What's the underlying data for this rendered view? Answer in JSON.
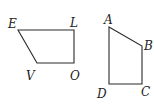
{
  "figure": {
    "stroke_color": "#2a2a2a",
    "label_color": "#222222",
    "shapes": [
      {
        "name": "EVOL",
        "vertices": [
          {
            "label": "E",
            "x": 18,
            "y": 30,
            "lx": 8,
            "ly": 28
          },
          {
            "label": "L",
            "x": 74,
            "y": 30,
            "lx": 70,
            "ly": 27
          },
          {
            "label": "O",
            "x": 74,
            "y": 63,
            "lx": 70,
            "ly": 80
          },
          {
            "label": "V",
            "x": 37,
            "y": 63,
            "lx": 26,
            "ly": 80
          }
        ]
      },
      {
        "name": "ABCD",
        "vertices": [
          {
            "label": "A",
            "x": 109,
            "y": 27,
            "lx": 104,
            "ly": 24
          },
          {
            "label": "B",
            "x": 142,
            "y": 46,
            "lx": 144,
            "ly": 50
          },
          {
            "label": "C",
            "x": 142,
            "y": 84,
            "lx": 141,
            "ly": 96
          },
          {
            "label": "D",
            "x": 109,
            "y": 84,
            "lx": 97,
            "ly": 98
          }
        ]
      }
    ]
  },
  "labels": {
    "E": "E",
    "L": "L",
    "O": "O",
    "V": "V",
    "A": "A",
    "B": "B",
    "C": "C",
    "D": "D"
  }
}
